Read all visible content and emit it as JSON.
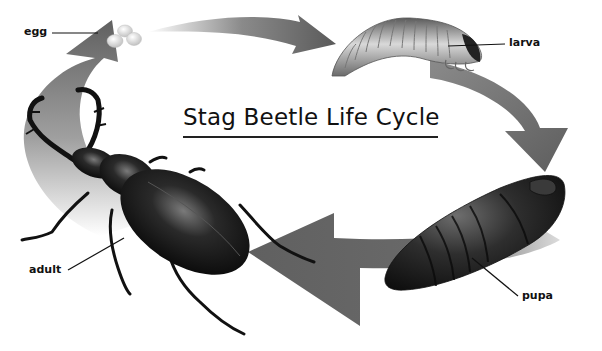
{
  "diagram": {
    "title": "Stag Beetle Life Cycle",
    "stages": [
      {
        "id": "egg",
        "label": "egg"
      },
      {
        "id": "larva",
        "label": "larva"
      },
      {
        "id": "pupa",
        "label": "pupa"
      },
      {
        "id": "adult",
        "label": "adult"
      }
    ],
    "flow": [
      "egg",
      "larva",
      "pupa",
      "adult",
      "egg"
    ],
    "colors": {
      "arrow": "#6b6b6b",
      "arrow_light": "#d8d8d8",
      "beetle": "#1a1a1a",
      "pupa": "#2a2a2a",
      "larva": "#9a9a9a",
      "egg": "#e6e6e6",
      "background": "#ffffff"
    }
  }
}
